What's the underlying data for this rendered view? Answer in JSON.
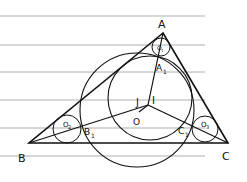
{
  "diagram": {
    "type": "geometry",
    "colors": {
      "ink": "#111111",
      "paper_lines": "#9a9a9a",
      "background": "#ffffff"
    },
    "paper_lines_y": [
      16,
      45,
      72,
      100,
      128,
      156
    ],
    "vertices": {
      "A": {
        "label": "A",
        "x": 163,
        "y": 33
      },
      "B": {
        "label": "B",
        "x": 29,
        "y": 143
      },
      "C": {
        "label": "C",
        "x": 228,
        "y": 143
      }
    },
    "points": {
      "A1": {
        "label": "A₁",
        "x": 159,
        "y": 58
      },
      "B1": {
        "label": "B₁",
        "x": 82,
        "y": 126
      },
      "C1": {
        "label": "C₁",
        "x": 190,
        "y": 126
      },
      "I": {
        "label": "I",
        "x": 148,
        "y": 104
      },
      "J": {
        "label": "J",
        "x": 145,
        "y": 104
      },
      "O": {
        "label": "O",
        "x": 138,
        "y": 110
      }
    },
    "circles": [
      {
        "name": "big-circle",
        "cx": 137,
        "cy": 110,
        "r": 57
      },
      {
        "name": "incircle",
        "cx": 150,
        "cy": 98,
        "r": 42
      },
      {
        "name": "circle-O1",
        "label": "O₁",
        "cx": 161,
        "cy": 47,
        "r": 9
      },
      {
        "name": "circle-O2",
        "label": "O₂",
        "cx": 67,
        "cy": 129,
        "r": 14
      },
      {
        "name": "circle-O3",
        "label": "O₃",
        "cx": 205,
        "cy": 129,
        "r": 13
      }
    ],
    "labels": {
      "A": "A",
      "B": "B",
      "C": "C",
      "A1": "A",
      "A1_sub": "1",
      "B1": "B",
      "B1_sub": "1",
      "C1": "C",
      "C1_sub": "1",
      "I": "I",
      "J": "J",
      "O": "O",
      "O1": "O",
      "O1_sub": "1",
      "O2": "O",
      "O2_sub": "2",
      "O3": "O",
      "O3_sub": "3"
    }
  }
}
